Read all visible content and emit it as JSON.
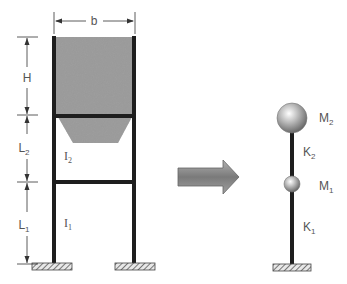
{
  "diagram": {
    "left_frame": {
      "dimensions": {
        "width_label": "b",
        "height_label": "H",
        "upper_story_label": "L",
        "upper_story_sub": "2",
        "lower_story_label": "L",
        "lower_story_sub": "1"
      },
      "inertia": {
        "upper_label": "I",
        "upper_sub": "2",
        "lower_label": "I",
        "lower_sub": "1"
      }
    },
    "arrow": {
      "meaning": "transforms-to"
    },
    "right_model": {
      "mass_top_label": "M",
      "mass_top_sub": "2",
      "mass_bottom_label": "M",
      "mass_bottom_sub": "1",
      "stiffness_top_label": "K",
      "stiffness_top_sub": "2",
      "stiffness_bottom_label": "K",
      "stiffness_bottom_sub": "1"
    },
    "colors": {
      "frame": "#1e1e1e",
      "fill": "#8a8a8a",
      "text": "#555555",
      "arrow": "#7a7a7a"
    }
  }
}
